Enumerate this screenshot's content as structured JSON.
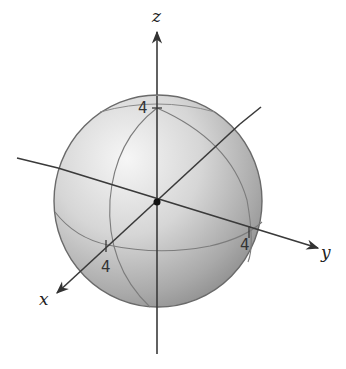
{
  "diagram": {
    "type": "3d-sphere-with-axes",
    "axes": {
      "x": {
        "label": "x",
        "tick_label": "4"
      },
      "y": {
        "label": "y",
        "tick_label": "4"
      },
      "z": {
        "label": "z",
        "tick_label": "4"
      }
    },
    "sphere": {
      "radius": 4
    },
    "colors": {
      "axis": "#3a3a3a",
      "sphere_light": "#f2f2f2",
      "sphere_mid": "#c8c8c8",
      "sphere_dark": "#8e8e8e",
      "outline": "#6a6a6a",
      "grid_curve": "#7c7c7c"
    }
  }
}
